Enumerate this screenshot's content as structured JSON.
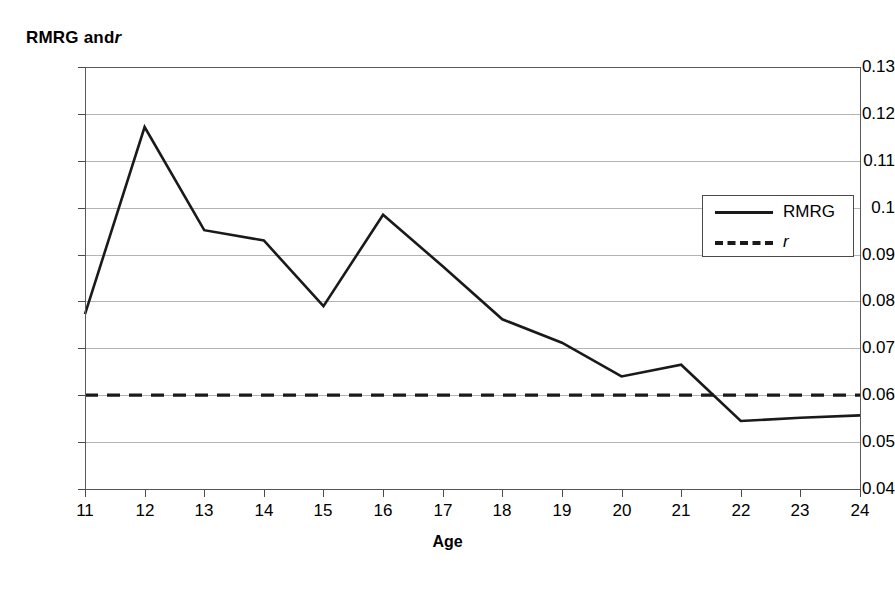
{
  "chart_data": {
    "type": "line",
    "title": "",
    "ylabel": "RMRG and r",
    "ylabel_plain": "RMRG and",
    "ylabel_italic": "r",
    "xlabel": "Age",
    "x": [
      11,
      12,
      13,
      14,
      15,
      16,
      17,
      18,
      19,
      20,
      21,
      22,
      23,
      24
    ],
    "xtick_labels": [
      "11",
      "12",
      "13",
      "14",
      "15",
      "16",
      "17",
      "18",
      "19",
      "20",
      "21",
      "22",
      "23",
      "24"
    ],
    "ytick_labels": [
      "0.13",
      "0.12",
      "0.11",
      "0.1",
      "0.09",
      "0.08",
      "0.07",
      "0.06",
      "0.05",
      "0.04"
    ],
    "ytick_values": [
      0.13,
      0.12,
      0.11,
      0.1,
      0.09,
      0.08,
      0.07,
      0.06,
      0.05,
      0.04
    ],
    "xlim": [
      11,
      24
    ],
    "ylim": [
      0.04,
      0.13
    ],
    "grid": true,
    "grid_axis": "y",
    "legend_position": "upper right",
    "series": [
      {
        "name": "RMRG",
        "style": "solid",
        "color": "#1a1a1a",
        "values": [
          0.0773,
          0.1172,
          0.0952,
          0.093,
          0.079,
          0.0985,
          0.0875,
          0.0762,
          0.0712,
          0.064,
          0.0665,
          0.0545,
          0.0552,
          0.0557
        ]
      },
      {
        "name": "r",
        "style": "dashed",
        "color": "#1a1a1a",
        "italic_label": true,
        "values": [
          0.06,
          0.06,
          0.06,
          0.06,
          0.06,
          0.06,
          0.06,
          0.06,
          0.06,
          0.06,
          0.06,
          0.06,
          0.06,
          0.06
        ]
      }
    ],
    "legend": [
      {
        "label": "RMRG",
        "style": "solid",
        "italic": false
      },
      {
        "label": "r",
        "style": "dashed",
        "italic": true
      }
    ],
    "colors": {
      "series_line": "#1a1a1a",
      "gridline": "#b4b4b4",
      "axis": "#5a5a5a",
      "background": "#ffffff"
    }
  }
}
